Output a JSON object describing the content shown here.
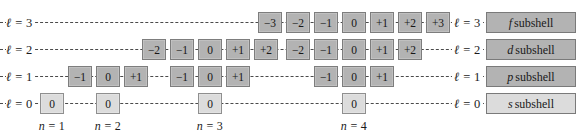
{
  "figure": {
    "colors": {
      "dark_box": "#b3b3b3",
      "light_box": "#dcdcdc",
      "box_border": "#8d8d8d",
      "dashed_line": "#4a4a4a",
      "text": "#1a1a1a",
      "background": "#ffffff"
    }
  },
  "rows": [
    {
      "ell_symbol": "ℓ",
      "ell_left_label": "ℓ = 3",
      "ell_right_label": "ℓ = 3",
      "ell_value": 3,
      "subshell_letter": "f",
      "subshell_label": "subshell",
      "shade": "dark",
      "groups": [
        {
          "n": 4,
          "m_values": [
            "−3",
            "−2",
            "−1",
            "0",
            "+1",
            "+2",
            "+3"
          ]
        }
      ]
    },
    {
      "ell_symbol": "ℓ",
      "ell_left_label": "ℓ = 2",
      "ell_right_label": "ℓ = 2",
      "ell_value": 2,
      "subshell_letter": "d",
      "subshell_label": "subshell",
      "shade": "dark",
      "groups": [
        {
          "n": 3,
          "m_values": [
            "−2",
            "−1",
            "0",
            "+1",
            "+2"
          ]
        },
        {
          "n": 4,
          "m_values": [
            "−2",
            "−1",
            "0",
            "+1",
            "+2"
          ]
        }
      ]
    },
    {
      "ell_symbol": "ℓ",
      "ell_left_label": "ℓ = 1",
      "ell_right_label": "ℓ = 1",
      "ell_value": 1,
      "subshell_letter": "p",
      "subshell_label": "subshell",
      "shade": "dark",
      "groups": [
        {
          "n": 2,
          "m_values": [
            "−1",
            "0",
            "+1"
          ]
        },
        {
          "n": 3,
          "m_values": [
            "−1",
            "0",
            "+1"
          ]
        },
        {
          "n": 4,
          "m_values": [
            "−1",
            "0",
            "+1"
          ]
        }
      ]
    },
    {
      "ell_symbol": "ℓ",
      "ell_left_label": "ℓ = 0",
      "ell_right_label": "ℓ = 0",
      "ell_value": 0,
      "subshell_letter": "s",
      "subshell_label": "subshell",
      "shade": "light",
      "groups": [
        {
          "n": 1,
          "m_values": [
            "0"
          ]
        },
        {
          "n": 2,
          "m_values": [
            "0"
          ]
        },
        {
          "n": 3,
          "m_values": [
            "0"
          ]
        },
        {
          "n": 4,
          "m_values": [
            "0"
          ]
        }
      ]
    }
  ],
  "columns": [
    {
      "n_label": "n = 1",
      "n_value": 1
    },
    {
      "n_label": "n = 2",
      "n_value": 2
    },
    {
      "n_label": "n = 3",
      "n_value": 3
    },
    {
      "n_label": "n = 4",
      "n_value": 4
    }
  ],
  "rendered": {
    "row_0": {
      "ell_left": "ℓ = 3",
      "ell_right": "ℓ = 3",
      "subshell_letter": "f",
      "subshell_word": "subshell",
      "m0": "−3",
      "m1": "−2",
      "m2": "−1",
      "m3": "0",
      "m4": "+1",
      "m5": "+2",
      "m6": "+3"
    },
    "row_1": {
      "ell_left": "ℓ = 2",
      "ell_right": "ℓ = 2",
      "subshell_letter": "d",
      "subshell_word": "subshell",
      "g0_m0": "−2",
      "g0_m1": "−1",
      "g0_m2": "0",
      "g0_m3": "+1",
      "g0_m4": "+2",
      "g1_m0": "−2",
      "g1_m1": "−1",
      "g1_m2": "0",
      "g1_m3": "+1",
      "g1_m4": "+2"
    },
    "row_2": {
      "ell_left": "ℓ = 1",
      "ell_right": "ℓ = 1",
      "subshell_letter": "p",
      "subshell_word": "subshell",
      "g0_m0": "−1",
      "g0_m1": "0",
      "g0_m2": "+1",
      "g1_m0": "−1",
      "g1_m1": "0",
      "g1_m2": "+1",
      "g2_m0": "−1",
      "g2_m1": "0",
      "g2_m2": "+1"
    },
    "row_3": {
      "ell_left": "ℓ = 0",
      "ell_right": "ℓ = 0",
      "subshell_letter": "s",
      "subshell_word": "subshell",
      "g0_m0": "0",
      "g1_m0": "0",
      "g2_m0": "0",
      "g3_m0": "0"
    },
    "n_labels": {
      "n1": "n = 1",
      "n2": "n = 2",
      "n3": "n = 3",
      "n4": "n = 4"
    }
  }
}
